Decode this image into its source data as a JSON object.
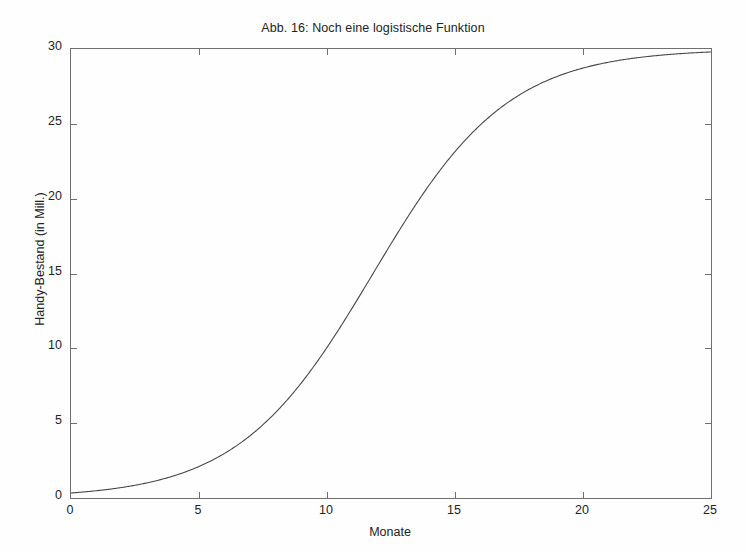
{
  "chart_data": {
    "type": "line",
    "title": "Abb. 16: Noch eine logistische Funktion",
    "xlabel": "Monate",
    "ylabel": "Handy-Bestand (in Mill.)",
    "xlim": [
      0,
      25
    ],
    "ylim": [
      0,
      30
    ],
    "xticks": [
      0,
      5,
      10,
      15,
      20,
      25
    ],
    "yticks": [
      0,
      5,
      10,
      15,
      20,
      25,
      30
    ],
    "xtick_labels": [
      "0",
      "5",
      "10",
      "15",
      "20",
      "25"
    ],
    "ytick_labels": [
      "0",
      "5",
      "10",
      "15",
      "20",
      "25",
      "30"
    ],
    "grid": false,
    "legend": null,
    "box": true,
    "tick_direction": "in",
    "line_color": "#444444",
    "line_width": 1,
    "series": [
      {
        "name": "logistische Funktion",
        "model": "logistic",
        "formula": "N(t) = 30 / (1 + exp(-0.38 * (t - 11.8)))",
        "saturation": 30,
        "growth_rate": 0.38,
        "midpoint": 11.8,
        "x": [
          0,
          1,
          2,
          3,
          4,
          5,
          6,
          7,
          8,
          9,
          10,
          11,
          12,
          13,
          14,
          15,
          16,
          17,
          18,
          19,
          20,
          21,
          22,
          23,
          24,
          25
        ],
        "y": [
          0.3,
          0.5,
          0.7,
          1.0,
          1.4,
          2.0,
          2.9,
          4.1,
          5.6,
          7.6,
          10.0,
          12.7,
          15.5,
          18.3,
          20.9,
          23.1,
          24.9,
          26.3,
          27.3,
          28.1,
          28.6,
          29.0,
          29.3,
          29.5,
          29.6,
          29.7
        ]
      }
    ],
    "annotations": []
  },
  "figure": {
    "background_color": "#fefefe",
    "axis_color": "#6f6f6f",
    "text_color": "#232323"
  }
}
